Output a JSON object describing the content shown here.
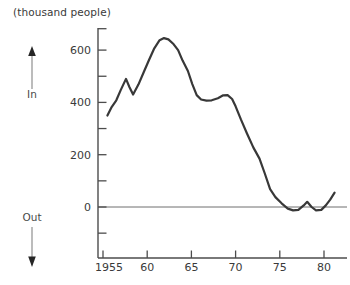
{
  "figure": {
    "title": "(thousand people)",
    "in_label": "In",
    "out_label": "Out"
  },
  "chart_data": {
    "type": "line",
    "title": "(thousand people)",
    "xlabel": "",
    "ylabel": "(thousand people)",
    "legend": false,
    "grid": false,
    "zero_line": true,
    "direction_annotations": [
      {
        "label": "In",
        "direction": "up"
      },
      {
        "label": "Out",
        "direction": "down"
      }
    ],
    "x_axis": {
      "ticks": [
        1955,
        1960,
        1965,
        1970,
        1975,
        1980
      ],
      "tick_labels": [
        "1955",
        "60",
        "65",
        "70",
        "75",
        "80"
      ],
      "range": [
        1954.4,
        1982.6
      ]
    },
    "y_axis": {
      "ticks": [
        -100,
        0,
        100,
        200,
        300,
        400,
        500,
        600
      ],
      "labeled_ticks": [
        0,
        200,
        400,
        600
      ],
      "unit": "thousand people",
      "range": [
        -190,
        685
      ]
    },
    "series": [
      {
        "name": "",
        "points": [
          [
            1955.5,
            350
          ],
          [
            1956.0,
            383
          ],
          [
            1956.5,
            408
          ],
          [
            1957.0,
            447
          ],
          [
            1957.6,
            490
          ],
          [
            1958.0,
            458
          ],
          [
            1958.4,
            430
          ],
          [
            1959.0,
            468
          ],
          [
            1959.6,
            515
          ],
          [
            1960.2,
            562
          ],
          [
            1960.8,
            607
          ],
          [
            1961.4,
            638
          ],
          [
            1961.9,
            646
          ],
          [
            1962.4,
            641
          ],
          [
            1963.0,
            622
          ],
          [
            1963.5,
            600
          ],
          [
            1964.0,
            560
          ],
          [
            1964.6,
            520
          ],
          [
            1965.1,
            470
          ],
          [
            1965.6,
            428
          ],
          [
            1966.1,
            411
          ],
          [
            1966.7,
            407
          ],
          [
            1967.3,
            408
          ],
          [
            1968.0,
            416
          ],
          [
            1968.6,
            427
          ],
          [
            1969.1,
            428
          ],
          [
            1969.6,
            413
          ],
          [
            1970.0,
            385
          ],
          [
            1970.6,
            335
          ],
          [
            1971.3,
            280
          ],
          [
            1972.0,
            228
          ],
          [
            1972.7,
            185
          ],
          [
            1973.3,
            128
          ],
          [
            1973.9,
            68
          ],
          [
            1974.5,
            38
          ],
          [
            1975.2,
            14
          ],
          [
            1975.9,
            -6
          ],
          [
            1976.5,
            -13
          ],
          [
            1977.1,
            -11
          ],
          [
            1977.7,
            6
          ],
          [
            1978.1,
            20
          ],
          [
            1978.6,
            0
          ],
          [
            1979.1,
            -13
          ],
          [
            1979.7,
            -11
          ],
          [
            1980.2,
            6
          ],
          [
            1980.7,
            28
          ],
          [
            1981.2,
            55
          ]
        ]
      }
    ],
    "colors": {
      "line": "#383838",
      "axis": "#4c4c4c",
      "zero_line": "#6e6e6e",
      "text": "#3a3a3a"
    }
  }
}
